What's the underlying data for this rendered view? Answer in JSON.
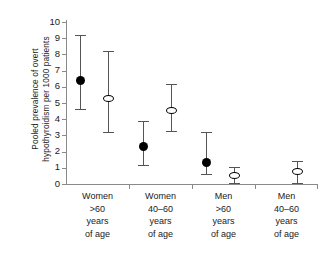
{
  "chart_data": {
    "type": "scatter",
    "title": "",
    "subtitle": "",
    "xlabel": "",
    "ylabel": "Pooled prevalence of overt hypothyroidism per 1000 patients",
    "ylabel_lines": [
      "Pooled prevalence of overt",
      "hypothyroidism per 1000 patients"
    ],
    "ylim": [
      0,
      10
    ],
    "yticks": [
      0,
      1,
      2,
      3,
      4,
      5,
      6,
      7,
      8,
      9,
      10
    ],
    "ytick_labels": [
      "0",
      "1",
      "2",
      "3",
      "4",
      "5",
      "6",
      "7",
      "8",
      "9",
      "10"
    ],
    "grid": false,
    "legend": "none",
    "error_bars": "95% confidence interval",
    "categories": [
      "Women >60 years of age",
      "Women 40-60 years of age",
      "Men >60 years of age",
      "Men 40-60 years of age"
    ],
    "category_label_lines": [
      [
        "Women",
        ">60",
        "years",
        "of age"
      ],
      [
        "Women",
        "40–60",
        "years",
        "of age"
      ],
      [
        "Men",
        ">60",
        "years",
        "of age"
      ],
      [
        "Men",
        "40–60",
        "years",
        "of age"
      ]
    ],
    "series": [
      {
        "name": "filled-circle",
        "marker": "filled circle",
        "color": "#000000",
        "values": [
          6.4,
          2.3,
          1.35,
          null
        ],
        "ci_low": [
          4.6,
          1.2,
          0.6,
          null
        ],
        "ci_high": [
          9.2,
          3.9,
          3.2,
          null
        ]
      },
      {
        "name": "open-circle",
        "marker": "open circle",
        "color": "#000000",
        "values": [
          5.3,
          4.55,
          0.5,
          0.8
        ],
        "ci_low": [
          3.2,
          3.25,
          0.05,
          0.05
        ],
        "ci_high": [
          8.2,
          6.15,
          1.05,
          1.45
        ]
      }
    ]
  },
  "axis": {
    "line_color": "#8a8a8a"
  }
}
